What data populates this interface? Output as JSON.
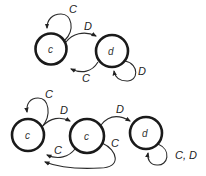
{
  "diagram": {
    "type": "state-machine",
    "top": {
      "states": [
        {
          "id": "s1",
          "label": "c",
          "cx": 51,
          "cy": 49
        },
        {
          "id": "s2",
          "label": "d",
          "cx": 112,
          "cy": 51
        }
      ],
      "edges": [
        {
          "from": "s1",
          "to": "s1",
          "label": "C"
        },
        {
          "from": "s1",
          "to": "s2",
          "label": "D"
        },
        {
          "from": "s2",
          "to": "s1",
          "label": "C"
        },
        {
          "from": "s2",
          "to": "s2",
          "label": "D"
        }
      ]
    },
    "bottom": {
      "states": [
        {
          "id": "b1",
          "label": "c",
          "cx": 28,
          "cy": 135
        },
        {
          "id": "b2",
          "label": "c",
          "cx": 87,
          "cy": 136
        },
        {
          "id": "b3",
          "label": "d",
          "cx": 146,
          "cy": 133
        }
      ],
      "edges": [
        {
          "from": "b1",
          "to": "b1",
          "label": "C"
        },
        {
          "from": "b1",
          "to": "b2",
          "label": "D"
        },
        {
          "from": "b2",
          "to": "b1",
          "label": "C"
        },
        {
          "from": "b2",
          "to": "b3",
          "label": "D"
        },
        {
          "from": "b3",
          "to": "b1",
          "label": "C"
        },
        {
          "from": "b3",
          "to": "b3",
          "label": "C, D"
        }
      ]
    }
  }
}
